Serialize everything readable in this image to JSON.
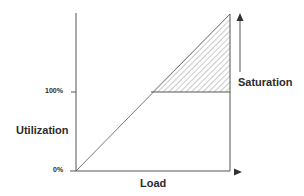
{
  "diagram": {
    "y_axis": {
      "title": "Utilization",
      "ticks": [
        "100%",
        "0%"
      ]
    },
    "x_axis": {
      "title": "Load"
    },
    "annotation": {
      "label": "Saturation",
      "direction": "up"
    },
    "colors": {
      "line": "#555555",
      "text": "#2b2b2b",
      "hatch": "#777777"
    }
  }
}
